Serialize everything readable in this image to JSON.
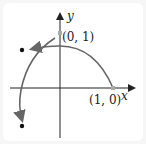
{
  "diagram": {
    "axes": {
      "x_label": "x",
      "y_label": "y"
    },
    "points": [
      {
        "label": "(0, 1)",
        "coords": [
          0,
          1
        ]
      },
      {
        "label": "(1, 0)",
        "coords": [
          1,
          0
        ]
      }
    ],
    "colors": {
      "curve": "#666666",
      "axis": "#222222",
      "point_marker": "#aaaaaa",
      "dot": "#111111"
    }
  }
}
